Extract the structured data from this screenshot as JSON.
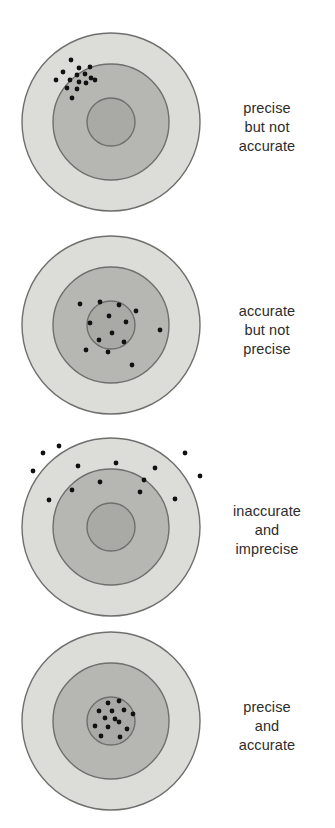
{
  "figure": {
    "background_color": "#ffffff",
    "width": 335,
    "height": 828
  },
  "style": {
    "outer_ring_fill": "#dcdcd9",
    "middle_ring_fill": "#b6b6b3",
    "inner_circle_fill": "#a9a9a6",
    "ring_stroke": "#6f6f6d",
    "dot_color": "#111111",
    "dot_radius": 2.4,
    "text_color": "#2c2c2c"
  },
  "targets": [
    {
      "id": "target-1",
      "name": "precise-but-not-accurate",
      "center_x": 111,
      "center_y": 122,
      "outer_radius": 89,
      "middle_radius": 58,
      "inner_radius": 24,
      "caption": {
        "lines": [
          "precise",
          "but not",
          "accurate"
        ],
        "text": "precise but not accurate",
        "center_y": 127
      },
      "dots": [
        {
          "x": 71,
          "y": 60
        },
        {
          "x": 79,
          "y": 68
        },
        {
          "x": 90,
          "y": 67
        },
        {
          "x": 63,
          "y": 72
        },
        {
          "x": 77,
          "y": 75
        },
        {
          "x": 85,
          "y": 74
        },
        {
          "x": 91,
          "y": 78
        },
        {
          "x": 56,
          "y": 80
        },
        {
          "x": 70,
          "y": 80
        },
        {
          "x": 79,
          "y": 82
        },
        {
          "x": 86,
          "y": 83
        },
        {
          "x": 95,
          "y": 80
        },
        {
          "x": 67,
          "y": 88
        },
        {
          "x": 77,
          "y": 89
        },
        {
          "x": 72,
          "y": 98
        }
      ]
    },
    {
      "id": "target-2",
      "name": "accurate-but-not-precise",
      "center_x": 111,
      "center_y": 325,
      "outer_radius": 89,
      "middle_radius": 58,
      "inner_radius": 24,
      "caption": {
        "lines": [
          "accurate",
          "but not",
          "precise"
        ],
        "text": "accurate but not precise",
        "center_y": 330
      },
      "dots": [
        {
          "x": 80,
          "y": 304
        },
        {
          "x": 100,
          "y": 302
        },
        {
          "x": 119,
          "y": 305
        },
        {
          "x": 136,
          "y": 311
        },
        {
          "x": 109,
          "y": 316
        },
        {
          "x": 126,
          "y": 322
        },
        {
          "x": 90,
          "y": 323
        },
        {
          "x": 112,
          "y": 333
        },
        {
          "x": 160,
          "y": 330
        },
        {
          "x": 99,
          "y": 340
        },
        {
          "x": 124,
          "y": 342
        },
        {
          "x": 86,
          "y": 350
        },
        {
          "x": 108,
          "y": 352
        },
        {
          "x": 132,
          "y": 365
        }
      ]
    },
    {
      "id": "target-3",
      "name": "inaccurate-and-imprecise",
      "center_x": 111,
      "center_y": 527,
      "outer_radius": 89,
      "middle_radius": 58,
      "inner_radius": 24,
      "caption": {
        "lines": [
          "inaccurate",
          "and",
          "imprecise"
        ],
        "text": "inaccurate and imprecise",
        "center_y": 530
      },
      "dots": [
        {
          "x": 59,
          "y": 446
        },
        {
          "x": 43,
          "y": 453
        },
        {
          "x": 33,
          "y": 471
        },
        {
          "x": 78,
          "y": 466
        },
        {
          "x": 116,
          "y": 463
        },
        {
          "x": 155,
          "y": 468
        },
        {
          "x": 185,
          "y": 453
        },
        {
          "x": 100,
          "y": 482
        },
        {
          "x": 144,
          "y": 480
        },
        {
          "x": 200,
          "y": 476
        },
        {
          "x": 72,
          "y": 490
        },
        {
          "x": 140,
          "y": 492
        },
        {
          "x": 49,
          "y": 500
        },
        {
          "x": 175,
          "y": 499
        }
      ]
    },
    {
      "id": "target-4",
      "name": "precise-and-accurate",
      "center_x": 111,
      "center_y": 721,
      "outer_radius": 89,
      "middle_radius": 58,
      "inner_radius": 24,
      "caption": {
        "lines": [
          "precise",
          "and",
          "accurate"
        ],
        "text": "precise and accurate",
        "center_y": 726
      },
      "dots": [
        {
          "x": 108,
          "y": 703
        },
        {
          "x": 119,
          "y": 701
        },
        {
          "x": 99,
          "y": 711
        },
        {
          "x": 112,
          "y": 711
        },
        {
          "x": 124,
          "y": 710
        },
        {
          "x": 133,
          "y": 714
        },
        {
          "x": 105,
          "y": 718
        },
        {
          "x": 115,
          "y": 719
        },
        {
          "x": 119,
          "y": 722
        },
        {
          "x": 95,
          "y": 726
        },
        {
          "x": 108,
          "y": 727
        },
        {
          "x": 127,
          "y": 729
        },
        {
          "x": 101,
          "y": 736
        },
        {
          "x": 120,
          "y": 737
        }
      ]
    }
  ]
}
